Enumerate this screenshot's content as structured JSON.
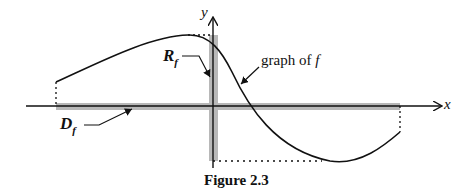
{
  "figure": {
    "caption": "Figure 2.3",
    "axis_x_label": "x",
    "axis_y_label": "y",
    "range_label_main": "R",
    "range_label_sub": "f",
    "domain_label_main": "D",
    "domain_label_sub": "f",
    "graph_label": "graph of ",
    "graph_label_fn": "f"
  },
  "colors": {
    "ink": "#111111",
    "band": "#b8b8b8"
  }
}
